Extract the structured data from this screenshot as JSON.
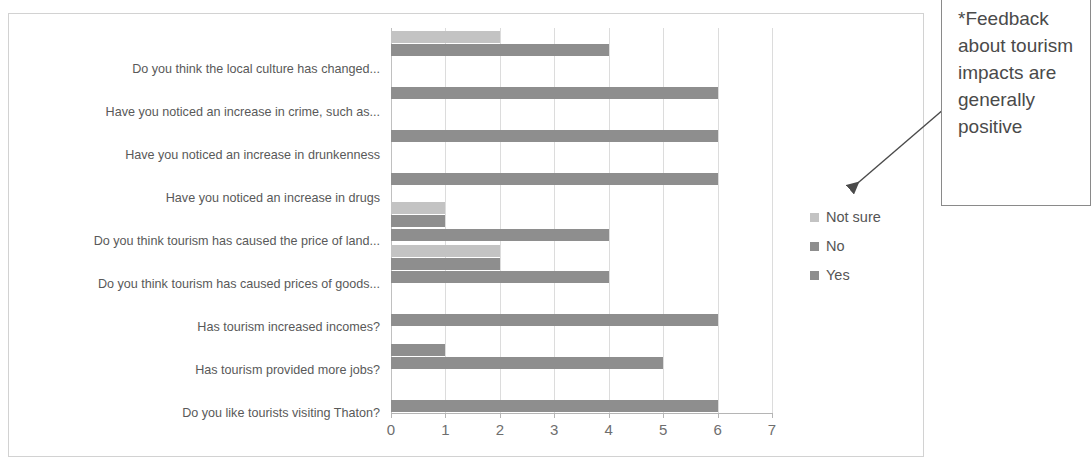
{
  "chart_data": {
    "type": "bar",
    "orientation": "horizontal",
    "title": "",
    "xlabel": "",
    "ylabel": "",
    "xlim": [
      0,
      7
    ],
    "xticks": [
      "0",
      "1",
      "2",
      "3",
      "4",
      "5",
      "6",
      "7"
    ],
    "grid": true,
    "legend_position": "right",
    "categories": [
      "Do you  think the local culture has changed...",
      "Have you noticed an increase in crime, such as...",
      "Have you noticed an increase in drunkenness",
      "Have you noticed an increase in drugs",
      "Do you think tourism has caused the price of land...",
      "Do you think tourism has caused prices of goods...",
      "Has tourism increased incomes?",
      "Has tourism provided more jobs?",
      "Do you like tourists visiting Thaton?"
    ],
    "series": [
      {
        "name": "Not sure",
        "color": "#c3c3c3",
        "values": [
          2,
          0,
          0,
          0,
          1,
          2,
          0,
          0,
          0
        ]
      },
      {
        "name": "No",
        "color": "#8e8e8e",
        "values": [
          4,
          6,
          6,
          6,
          1,
          2,
          0,
          1,
          0
        ]
      },
      {
        "name": "Yes",
        "color": "#8e8e8e",
        "values": [
          0,
          0,
          0,
          0,
          4,
          4,
          6,
          5,
          6
        ]
      }
    ]
  },
  "legend": {
    "items": [
      {
        "label": "Not sure",
        "swatch": "notsure"
      },
      {
        "label": "No",
        "swatch": "no"
      },
      {
        "label": "Yes",
        "swatch": "yes"
      }
    ]
  },
  "annotation": {
    "text": "*Feedback about tourism impacts are generally positive"
  }
}
